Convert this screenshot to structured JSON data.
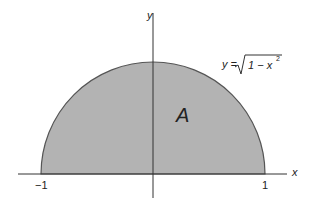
{
  "figure": {
    "axis_x_label": "x",
    "axis_y_label": "y",
    "tick_left": "−1",
    "tick_right": "1",
    "region_label": "A",
    "curve_label_lhs": "y =",
    "curve_label_radicand": "1 − x",
    "curve_label_exp": "2",
    "fill_color": "#b3b3b3",
    "stroke_color": "#444444"
  }
}
